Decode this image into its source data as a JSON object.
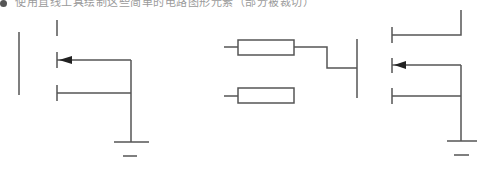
{
  "caption": {
    "text": "使用直线工具绘制这些简单的电路图形元素（部分被裁切）"
  },
  "colors": {
    "stroke": "#555555",
    "arrow": "#222222",
    "background": "#ffffff"
  },
  "figures": [
    {
      "name": "mosfet-left",
      "description": "MOSFET symbol with gate, three channel segments, arrow, and ground"
    },
    {
      "name": "resistor-gate-circuit",
      "description": "Two resistors, one wired to a gate line"
    },
    {
      "name": "mosfet-right",
      "description": "MOSFET symbol with drain connection, arrow, and ground"
    }
  ]
}
